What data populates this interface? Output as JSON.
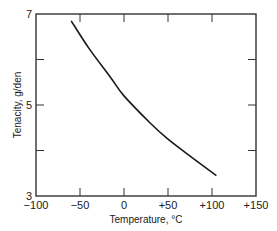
{
  "chart_data": {
    "type": "line",
    "title": "",
    "xlabel": "Temperature, °C",
    "ylabel": "Tenacity, g/den",
    "xlim": [
      -100,
      150
    ],
    "ylim": [
      3,
      7
    ],
    "x_ticks": [
      -100,
      -50,
      0,
      50,
      100,
      150
    ],
    "x_tick_labels": [
      "−100",
      "−50",
      "0",
      "+50",
      "+100",
      "+150"
    ],
    "y_ticks": [
      3,
      4,
      5,
      6,
      7
    ],
    "y_tick_labels": [
      "3",
      "",
      "5",
      "",
      "7"
    ],
    "grid": false,
    "legend": null,
    "series": [
      {
        "name": "Tenacity vs temperature",
        "color": "#1a1a1a",
        "x": [
          -60,
          -40,
          -15,
          0,
          30,
          50,
          77,
          105
        ],
        "y": [
          6.85,
          6.25,
          5.6,
          5.2,
          4.6,
          4.25,
          3.85,
          3.45
        ]
      }
    ]
  },
  "plot": {
    "frame_color": "#333333",
    "left": 36,
    "right": 256,
    "top": 14,
    "bottom": 196
  }
}
